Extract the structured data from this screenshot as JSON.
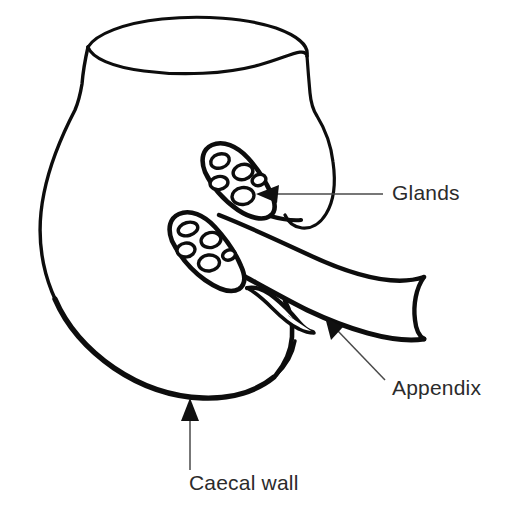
{
  "figure": {
    "background_color": "#ffffff",
    "stroke_color": "#0d0d0d",
    "text_color": "#2b2b2b",
    "width": 509,
    "height": 516
  },
  "labels": [
    {
      "id": "glands",
      "text": "Glands",
      "x": 392,
      "y": 194,
      "arrow": "left",
      "target": "upper-gland"
    },
    {
      "id": "appendix",
      "text": "Appendix",
      "x": 392,
      "y": 389,
      "arrow": "up-left",
      "target": "appendix-tube"
    },
    {
      "id": "caecal_wall",
      "text": "Caecal wall",
      "x": 189,
      "y": 484,
      "arrow": "up",
      "target": "caecum-bottom-wall"
    }
  ],
  "structures": {
    "caecum": {
      "name": "Caecum",
      "description": "Jar-shaped sac with open elliptical rim at top"
    },
    "appendix": {
      "name": "Appendix",
      "description": "Tubular projection extending to the right, cut at image edge"
    },
    "upper_gland": {
      "name": "Upper gland",
      "cell_count": 5
    },
    "lower_gland": {
      "name": "Lower gland",
      "cell_count": 5
    }
  }
}
